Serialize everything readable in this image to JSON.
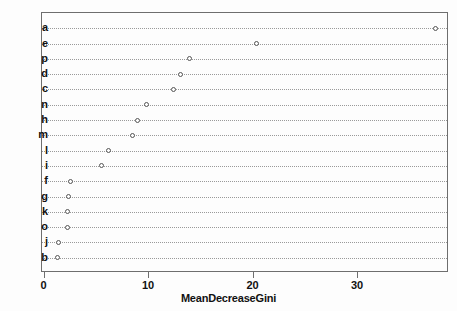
{
  "chart_data": {
    "type": "scatter",
    "title": "",
    "subtitle": "",
    "xlabel": "MeanDecreaseGini",
    "ylabel": "",
    "orientation": "horizontal",
    "xlim": [
      0,
      38.8
    ],
    "xticks": [
      0,
      10,
      20,
      30
    ],
    "xtick_labels": [
      "0",
      "10",
      "20",
      "30"
    ],
    "grid": "horizontal-dotted",
    "legend": "none",
    "categories": [
      "a",
      "e",
      "p",
      "d",
      "c",
      "n",
      "h",
      "m",
      "l",
      "i",
      "f",
      "g",
      "k",
      "o",
      "j",
      "b"
    ],
    "values": [
      37.4,
      20.3,
      13.9,
      13.0,
      12.3,
      9.8,
      8.9,
      8.4,
      6.1,
      5.5,
      2.5,
      2.3,
      2.2,
      2.2,
      1.3,
      1.2
    ],
    "points": [
      {
        "label": "a",
        "value": 37.4
      },
      {
        "label": "e",
        "value": 20.3
      },
      {
        "label": "p",
        "value": 13.9
      },
      {
        "label": "d",
        "value": 13.0
      },
      {
        "label": "c",
        "value": 12.3
      },
      {
        "label": "n",
        "value": 9.8
      },
      {
        "label": "h",
        "value": 8.9
      },
      {
        "label": "m",
        "value": 8.4
      },
      {
        "label": "l",
        "value": 6.1
      },
      {
        "label": "i",
        "value": 5.5
      },
      {
        "label": "f",
        "value": 2.5
      },
      {
        "label": "g",
        "value": 2.3
      },
      {
        "label": "k",
        "value": 2.2
      },
      {
        "label": "o",
        "value": 2.2
      },
      {
        "label": "j",
        "value": 1.3
      },
      {
        "label": "b",
        "value": 1.2
      }
    ],
    "marker": "open-circle",
    "colors": {
      "background": "#fdfdfd",
      "frame": "#6e6e6e",
      "grid": "#9a9a9a",
      "marker_stroke": "#555555",
      "marker_fill": "#ffffff",
      "text": "#111111"
    }
  }
}
